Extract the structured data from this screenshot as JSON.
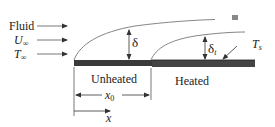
{
  "diagram": {
    "type": "thermal-entry-length-flat-plate",
    "fluid_labels": {
      "fluid": "Fluid",
      "velocity_symbol": "U",
      "velocity_sub": "∞",
      "temp_symbol": "T",
      "temp_sub": "∞"
    },
    "plate": {
      "unheated_label": "Unheated",
      "heated_label": "Heated",
      "surface_temp_symbol": "T",
      "surface_temp_sub": "s",
      "plate_color": "#3a3a3a"
    },
    "boundary_layers": {
      "velocity_symbol": "δ",
      "thermal_symbol": "δ",
      "thermal_sub": "t"
    },
    "dimensions": {
      "x0_symbol": "x",
      "x0_sub": "0",
      "x_symbol": "x"
    },
    "colors": {
      "line": "#555555",
      "text": "#222222"
    }
  }
}
